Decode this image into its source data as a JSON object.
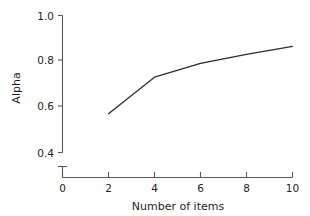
{
  "chart_data": {
    "type": "line",
    "title": "",
    "subtitle": "",
    "xlabel": "Number of items",
    "ylabel": "Alpha",
    "x": [
      2,
      4,
      6,
      8,
      10
    ],
    "series": [
      {
        "name": "Alpha",
        "values": [
          0.57,
          0.73,
          0.79,
          0.83,
          0.865
        ],
        "color": "#2b2b2b"
      }
    ],
    "xlim": [
      0,
      10
    ],
    "ylim": [
      0.4,
      1.0
    ],
    "xticks": [
      0,
      2,
      4,
      6,
      8,
      10
    ],
    "yticks": [
      0.4,
      0.6,
      0.8,
      1.0
    ],
    "xtick_labels": [
      "0",
      "2",
      "4",
      "6",
      "8",
      "10"
    ],
    "ytick_labels": [
      "0.4",
      "0.6",
      "0.8",
      "1.0"
    ],
    "grid": false,
    "legend": false,
    "legend_position": "none",
    "y_axis_break": true,
    "annotations": []
  },
  "axes": {
    "x_title": "Number of items",
    "y_title": "Alpha",
    "x_tick_labels": [
      "0",
      "2",
      "4",
      "6",
      "8",
      "10"
    ],
    "y_tick_labels": [
      "1.0",
      "0.8",
      "0.6",
      "0.4"
    ]
  },
  "colors": {
    "line": "#2b2b2b",
    "axis": "#58595b",
    "text": "#231f20",
    "background": "#ffffff"
  }
}
